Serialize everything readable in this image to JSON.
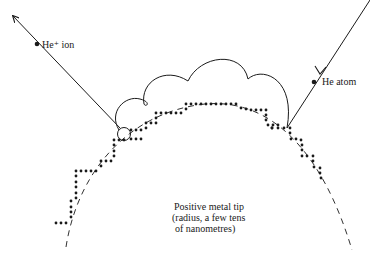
{
  "diagram": {
    "labels": {
      "ion": "He⁺ ion",
      "atom": "He atom",
      "tip_line1": "Positive metal tip",
      "tip_line2": "(radius, a few tens",
      "tip_line3": "of nanometres)"
    },
    "elements": {
      "ion_trajectory": "arrow from ionization point outward (upper-left)",
      "atom_trajectory": "arrow incoming from upper-right toward tip",
      "hopping_path": "series of arcs bouncing over tip surface",
      "ionization_point": "small circle at tip surface",
      "tip_outline": "dashed arc",
      "atomic_steps": "dotted staircase atom rows"
    },
    "colors": {
      "ink": "#1a1a1a",
      "background": "#ffffff"
    }
  }
}
